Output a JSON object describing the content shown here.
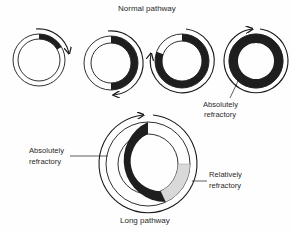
{
  "diagram": {
    "top_title": "Normal pathway",
    "bottom_title": "Long pathway",
    "labels": {
      "top_absolute_line1": "Absolutely",
      "top_absolute_line2": "refractory",
      "long_absolute_line1": "Absolutely",
      "long_absolute_line2": "refractory",
      "long_relative_line1": "Relatively",
      "long_relative_line2": "refractory"
    },
    "colors": {
      "absolutely_refractory": "#1e1e1e",
      "relatively_refractory": "#d9d9d9",
      "excitable": "#ffffff",
      "stroke": "#1a1a1a"
    },
    "normal_pathway_stages": [
      {
        "stage": 1,
        "absolutely_refractory_arc_deg": [
          0,
          60
        ]
      },
      {
        "stage": 2,
        "absolutely_refractory_arc_deg": [
          0,
          180
        ]
      },
      {
        "stage": 3,
        "absolutely_refractory_arc_deg": [
          0,
          290
        ]
      },
      {
        "stage": 4,
        "absolutely_refractory_arc_deg": [
          0,
          360
        ]
      }
    ],
    "long_pathway": {
      "excitable_arc_deg": [
        0,
        90
      ],
      "relatively_refractory_arc_deg": [
        90,
        155
      ],
      "absolutely_refractory_arc_deg": [
        155,
        360
      ]
    }
  }
}
